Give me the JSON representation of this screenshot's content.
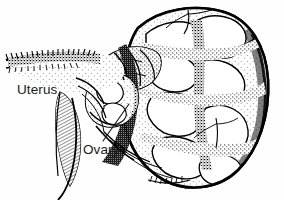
{
  "figure": {
    "kind": "anatomical-line-drawing",
    "style": "pen-and-ink stipple and hatch engraving",
    "background_color": "#fefefe",
    "ink_color": "#000000",
    "label_color": "#1a1a1a",
    "width": 284,
    "height": 200
  },
  "labels": [
    {
      "id": "uterus",
      "text": "Uterus",
      "x": 17,
      "y": 83,
      "has_leader_line": false
    },
    {
      "id": "ovary",
      "text": "Ovary",
      "x": 83,
      "y": 143,
      "has_leader_line": true,
      "leader_line": {
        "from_x": 103,
        "from_y": 141,
        "to_x": 129,
        "to_y": 104
      }
    }
  ],
  "structures": [
    {
      "id": "uterus-body",
      "name": "Uterus",
      "description": "Elongated horizontal organ at left with serrated serosal border"
    },
    {
      "id": "broad-ligament",
      "name": "Broad ligament",
      "description": "Fine parallel hatched membrane descending at lower left"
    },
    {
      "id": "ovary",
      "name": "Ovary",
      "description": "Small rounded structure in mid-field, target of the Ovary leader line"
    },
    {
      "id": "ovarian-mass",
      "name": "Ovarian mass",
      "description": "Large multilobulated tumour occupying the right two thirds of the field"
    }
  ]
}
